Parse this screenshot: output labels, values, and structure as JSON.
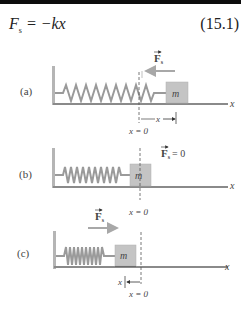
{
  "equation": {
    "lhs_symbol": "F",
    "lhs_subscript": "s",
    "rhs": " = −kx",
    "number": "(15.1)"
  },
  "panels": [
    {
      "label": "(a)",
      "force_label": "F",
      "force_subscript": "s",
      "force_direction": "left",
      "mass_label": "m",
      "axis_label": "x",
      "origin_label": "x = 0",
      "displacement_label": "x",
      "displacement_direction": "right"
    },
    {
      "label": "(b)",
      "force_label": "F",
      "force_subscript": "s",
      "force_value": "= 0",
      "mass_label": "m",
      "axis_label": "x",
      "origin_label": "x = 0"
    },
    {
      "label": "(c)",
      "force_label": "F",
      "force_subscript": "s",
      "force_direction": "right",
      "mass_label": "m",
      "axis_label": "x",
      "origin_label": "x = 0",
      "displacement_label": "x",
      "displacement_direction": "left"
    }
  ],
  "colors": {
    "spring": "#9a9a9a",
    "mass_fill": "#c4c4c4",
    "force_arrow": "#a8a8a8",
    "floor": "#8a8a8a",
    "top_bar": "#0d0d0d"
  }
}
